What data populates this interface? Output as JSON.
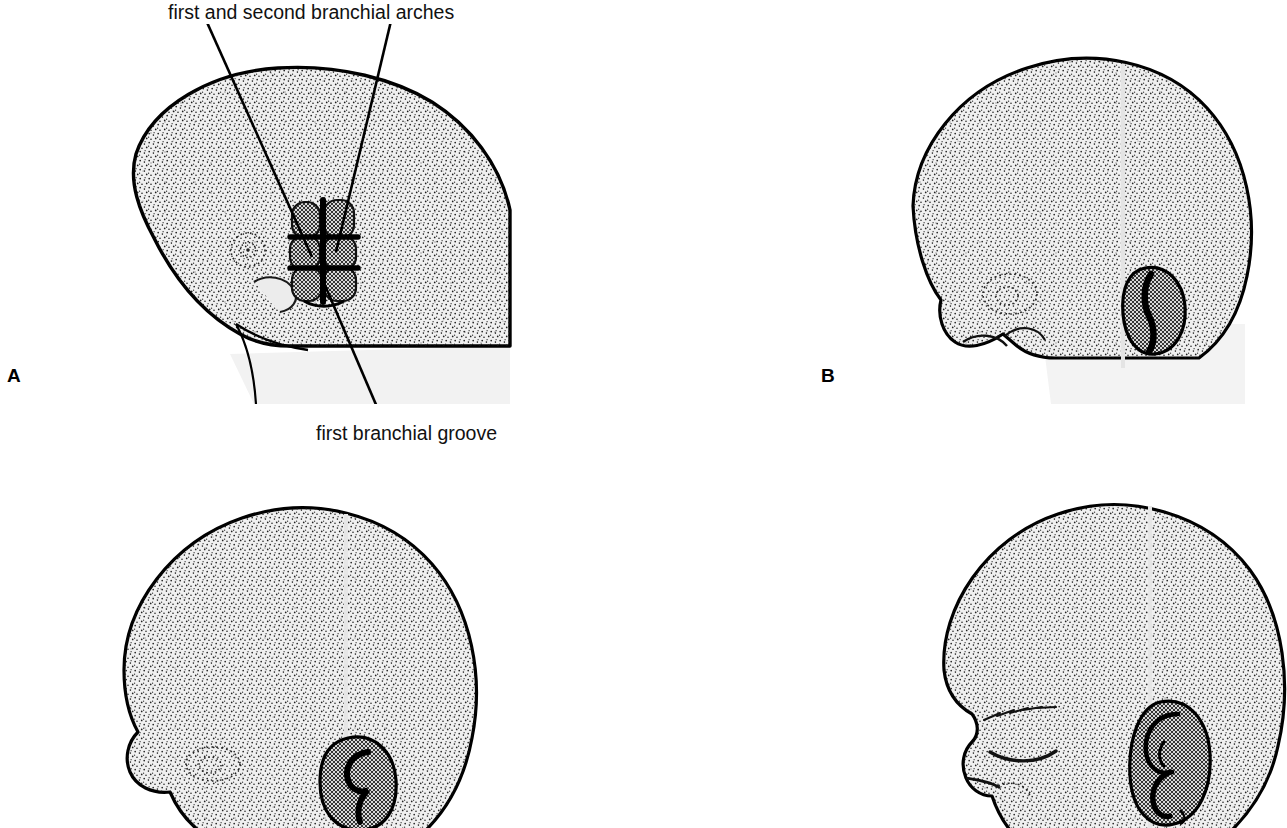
{
  "figure": {
    "background_color": "#ffffff",
    "ink_color": "#000000",
    "skin_fill_color": "#f0f0f0",
    "ear_fill_color": "#9a9a9a"
  },
  "callouts": [
    {
      "id": "arches",
      "text": "first and second branchial arches",
      "points_to": "branchial-hillocks-panel-a",
      "leader_count": 2
    },
    {
      "id": "groove",
      "text": "first branchial groove",
      "points_to": "branchial-groove-panel-a",
      "leader_count": 1
    }
  ],
  "panels": [
    {
      "id": "a",
      "letter": "A",
      "description": "Embryonic head in profile showing six branchial hillocks arranged around the first branchial groove",
      "features": [
        "optic-vesicle",
        "maxillary-prominence",
        "branchial-hillocks",
        "branchial-groove",
        "neck-fold"
      ]
    },
    {
      "id": "b",
      "letter": "B",
      "description": "Embryonic head with the hillocks fused into an early bean-shaped auricle primordium",
      "features": [
        "eye-primordium",
        "nose-bud",
        "lower-jaw",
        "early-auricle"
      ]
    },
    {
      "id": "c",
      "letter": "C",
      "description": "Fetal head with the auricle showing a developing helix and concha",
      "features": [
        "eye",
        "developing-auricle",
        "helix",
        "concha"
      ]
    },
    {
      "id": "d",
      "letter": "D",
      "description": "Fetal head with a fully formed auricle, closed eyelid, eyebrow and nostril",
      "features": [
        "eyebrow",
        "closed-eyelid",
        "nose",
        "nostril",
        "mature-auricle",
        "helix",
        "antihelix",
        "concha",
        "lobule"
      ]
    }
  ]
}
